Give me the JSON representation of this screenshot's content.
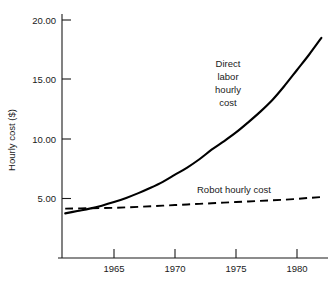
{
  "chart_data": {
    "type": "line",
    "title": "",
    "xlabel": "",
    "ylabel": "Hourly cost ($)",
    "xlim": [
      1961,
      1982
    ],
    "ylim": [
      0,
      21.5
    ],
    "grid": false,
    "legend": "inline-annotations",
    "xticks": [
      1965,
      1970,
      1975,
      1980
    ],
    "xticklabels": [
      "1965",
      "1970",
      "1975",
      "1980"
    ],
    "yticks": [
      5.0,
      10.0,
      15.0,
      20.0
    ],
    "yticklabels": [
      "5.00",
      "10.00",
      "15.00",
      "20.00"
    ],
    "annotations": [
      {
        "id": "direct-labor",
        "lines": [
          "Direct",
          "labor",
          "hourly",
          "cost"
        ],
        "x": 1971.5,
        "y": 15.2
      },
      {
        "id": "robot",
        "lines": [
          "Robot hourly cost"
        ],
        "x": 1972.0,
        "y": 6.4
      }
    ],
    "series": [
      {
        "name": "Direct labor hourly cost",
        "style": "solid",
        "x": [
          1961.0,
          1962.0,
          1963.0,
          1964.0,
          1965.0,
          1966.0,
          1967.0,
          1968.0,
          1969.0,
          1970.0,
          1971.0,
          1972.0,
          1973.0,
          1974.0,
          1975.0,
          1976.0,
          1977.0,
          1978.0,
          1979.0,
          1980.0,
          1981.0,
          1982.0
        ],
        "values": [
          3.75,
          3.95,
          4.15,
          4.4,
          4.7,
          5.05,
          5.45,
          5.9,
          6.4,
          7.0,
          7.6,
          8.3,
          9.1,
          9.8,
          10.55,
          11.4,
          12.3,
          13.3,
          14.5,
          15.8,
          17.1,
          18.5
        ]
      },
      {
        "name": "Robot hourly cost",
        "style": "dashed",
        "x": [
          1961.0,
          1963.0,
          1965.0,
          1967.0,
          1969.0,
          1971.0,
          1973.0,
          1975.0,
          1977.0,
          1979.0,
          1981.0,
          1982.0
        ],
        "values": [
          4.15,
          4.18,
          4.22,
          4.3,
          4.4,
          4.5,
          4.6,
          4.7,
          4.8,
          4.9,
          5.05,
          5.12
        ]
      }
    ]
  },
  "figure": {
    "background_color": "#ffffff",
    "ink_color": "#000000"
  }
}
